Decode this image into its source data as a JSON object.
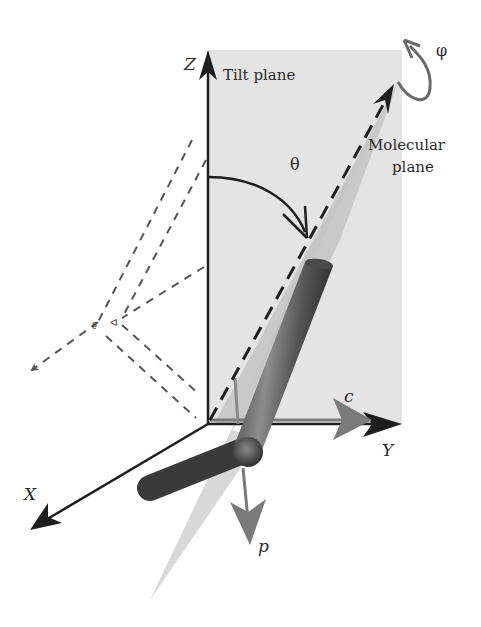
{
  "figure": {
    "labels": {
      "z_axis": "Z",
      "y_axis": "Y",
      "x_axis": "X",
      "tilt_plane": "Tilt plane",
      "molecular_plane_line1": "Molecular",
      "molecular_plane_line2": "plane",
      "theta": "θ",
      "phi": "φ",
      "c_vector": "c",
      "p_vector": "p"
    },
    "colors": {
      "tilt_plane_fill": "#e4e4e4",
      "molecular_plane_fill": "#c8c8c8",
      "axis_stroke": "#1e1e1e",
      "rod_dark": "#3a3a3a",
      "rod_light": "#8a8a8a",
      "vector_gray": "#7a7a7a",
      "dashed_stroke": "#555555"
    }
  }
}
